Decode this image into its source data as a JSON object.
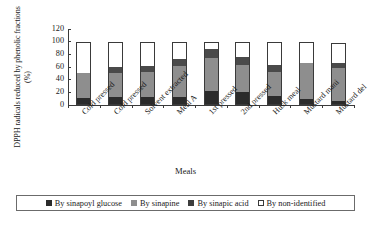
{
  "chart_data": {
    "type": "bar",
    "subtype": "stacked-bar",
    "title": "",
    "xlabel": "Meals",
    "ylabel": "DPPH radicals reduced by phenolic fractions (%)",
    "ylim": [
      0,
      120
    ],
    "yticks": [
      0,
      20,
      40,
      60,
      80,
      100,
      120
    ],
    "grid": false,
    "legend_position": "bottom",
    "categories": [
      "Cold pressed",
      "Cold pressed",
      "Solvent extracted",
      "Meal A",
      "1st pressed",
      "2nd pressed",
      "Husk meal",
      "Mustard mani",
      "Mustard del"
    ],
    "series": [
      {
        "name": "By sinapoyl glucose",
        "color": "#2b2b2b",
        "values": [
          11,
          12,
          12,
          13,
          22,
          21,
          15,
          9,
          7
        ]
      },
      {
        "name": "By sinapine",
        "color": "#8e8e8e",
        "values": [
          39,
          39,
          40,
          49,
          52,
          42,
          37,
          57,
          52
        ]
      },
      {
        "name": "By sinapic acid",
        "color": "#4a4a4a",
        "values": [
          0,
          9,
          9,
          10,
          15,
          13,
          11,
          0,
          8
        ]
      },
      {
        "name": "By non-identified",
        "color": "#ffffff",
        "values": [
          50,
          40,
          39,
          28,
          11,
          23,
          36,
          33,
          31
        ]
      }
    ],
    "cumulative_tops": [
      [
        11,
        50,
        50,
        100
      ],
      [
        12,
        51,
        60,
        100
      ],
      [
        12,
        52,
        61,
        100
      ],
      [
        13,
        62,
        72,
        100
      ],
      [
        22,
        74,
        89,
        100
      ],
      [
        21,
        63,
        76,
        99
      ],
      [
        15,
        52,
        63,
        99
      ],
      [
        9,
        66,
        66,
        99
      ],
      [
        7,
        59,
        67,
        98
      ]
    ]
  },
  "legend": {
    "entries": [
      {
        "label": "By sinapoyl glucose",
        "swatch": "square-dark-icon"
      },
      {
        "label": "By sinapine",
        "swatch": "square-gray-icon"
      },
      {
        "label": "By sinapic acid",
        "swatch": "square-darkgray-icon"
      },
      {
        "label": "By non-identified",
        "swatch": "square-white-icon"
      }
    ]
  }
}
